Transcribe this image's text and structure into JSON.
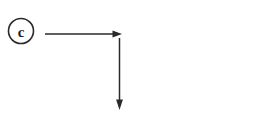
{
  "canvas": {
    "width": 274,
    "height": 115,
    "background_color": "#ffffff"
  },
  "figure": {
    "stroke_color": "#2a2a2a",
    "label_color": "#1f1f1f"
  },
  "step_marker": {
    "label": "c",
    "shape": "circle",
    "center_x": 21,
    "center_y": 31,
    "radius": 12.5,
    "stroke_width": 1.6
  },
  "arrows": [
    {
      "name": "right-arrow",
      "direction": "right",
      "x1": 45,
      "y1": 34,
      "x2": 122,
      "y2": 34,
      "stroke_width": 1.5,
      "head_length": 9,
      "head_width": 7
    },
    {
      "name": "down-arrow",
      "direction": "down",
      "x1": 119.5,
      "y1": 38,
      "x2": 119.5,
      "y2": 110,
      "stroke_width": 1.5,
      "head_length": 10,
      "head_width": 7
    }
  ]
}
